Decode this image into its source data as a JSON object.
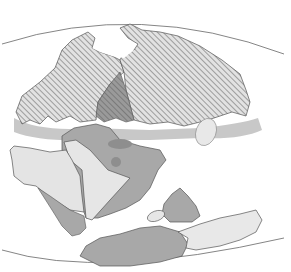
{
  "map": {
    "type": "paleogeographic-reconstruction",
    "projection": "globe-lens",
    "colors": {
      "background": "#ffffff",
      "outline": "#555555",
      "hatch_fill": "#d6d6d6",
      "hatch_line": "#7a7a7a",
      "dark_gray": "#8e8e8e",
      "mid_gray": "#a8a8a8",
      "light_gray": "#c4c4c4",
      "pale_gray": "#e6e6e6"
    },
    "regions": [
      {
        "name": "northern-landmass-west",
        "fill": "hatched"
      },
      {
        "name": "northern-landmass-east",
        "fill": "hatched"
      },
      {
        "name": "central-overlap-zone",
        "fill": "dark-gray-hatched"
      },
      {
        "name": "southern-landmass-west",
        "fill": "pale-gray"
      },
      {
        "name": "southern-landmass-central",
        "fill": "pale-gray"
      },
      {
        "name": "southern-landmass-shelf",
        "fill": "mid-gray"
      },
      {
        "name": "southeast-fragment",
        "fill": "mid-gray"
      },
      {
        "name": "southern-fragment-large",
        "fill": "mid-gray"
      },
      {
        "name": "southern-fragment-east",
        "fill": "pale-gray"
      }
    ]
  }
}
